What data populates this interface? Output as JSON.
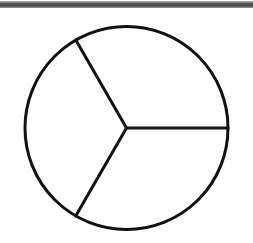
{
  "figure": {
    "shape": "circle-divided-into-three-equal-sectors",
    "center": [
      126.5,
      128
    ],
    "radius": 101.5,
    "stroke_color": "#111111",
    "stroke_width": 3,
    "fill_color": "#ffffff",
    "top_band_color": "#555555",
    "spokes": [
      {
        "name": "spoke-right",
        "angle_deg": 0
      },
      {
        "name": "spoke-upper-left",
        "angle_deg": 120
      },
      {
        "name": "spoke-lower-left",
        "angle_deg": 240
      }
    ],
    "sectors": 3
  }
}
